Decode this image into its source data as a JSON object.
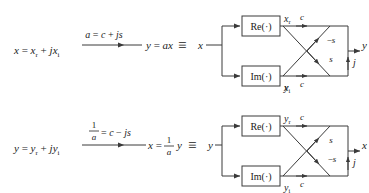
{
  "figure": {
    "type": "signal-flow-diagram",
    "background": "#ffffff",
    "stroke": "#3a3a3a",
    "rows": [
      {
        "id": "row-forward",
        "lhs": "x = xᵣ + jxᵢ",
        "lhs_parts": {
          "var": "x",
          "real": "x",
          "real_sub": "r",
          "imag": "x",
          "imag_sub": "i",
          "j": "j"
        },
        "arrow_label": "a = c + js",
        "arrow_label_is_fraction": false,
        "rhs": "y = ax",
        "equiv": "≡",
        "diagram": {
          "input": "x",
          "output": "y",
          "blocks": [
            {
              "name": "re-block",
              "label": "Re(·)"
            },
            {
              "name": "im-block",
              "label": "Im(·)"
            }
          ],
          "taps": [
            {
              "name": "top-tap",
              "label": "x",
              "sub": "r"
            },
            {
              "name": "bottom-tap",
              "label": "x",
              "sub": "i"
            }
          ],
          "gains": [
            {
              "name": "gain-top-straight",
              "label": "c",
              "path": "top-to-top"
            },
            {
              "name": "gain-cross-up",
              "label": "−s",
              "path": "bottom-to-top"
            },
            {
              "name": "gain-cross-down",
              "label": "s",
              "path": "top-to-bottom"
            },
            {
              "name": "gain-bottom-straight",
              "label": "c",
              "path": "bottom-to-bottom"
            }
          ],
          "sum_label": "j"
        }
      },
      {
        "id": "row-inverse",
        "lhs": "y = yᵣ + jyᵢ",
        "lhs_parts": {
          "var": "y",
          "real": "y",
          "real_sub": "r",
          "imag": "y",
          "imag_sub": "i",
          "j": "j"
        },
        "arrow_label": "1/a = c − js",
        "arrow_label_is_fraction": true,
        "arrow_numerator": "1",
        "arrow_denominator": "a",
        "arrow_rest": "= c − js",
        "rhs": "x = (1/a) y",
        "rhs_numerator": "1",
        "rhs_denominator": "a",
        "rhs_lead": "x =",
        "rhs_tail": "y",
        "equiv": "≡",
        "diagram": {
          "input": "y",
          "output": "x",
          "blocks": [
            {
              "name": "re-block",
              "label": "Re(·)"
            },
            {
              "name": "im-block",
              "label": "Im(·)"
            }
          ],
          "taps": [
            {
              "name": "top-tap",
              "label": "y",
              "sub": "r"
            },
            {
              "name": "bottom-tap",
              "label": "y",
              "sub": "i"
            }
          ],
          "gains": [
            {
              "name": "gain-top-straight",
              "label": "c",
              "path": "top-to-top"
            },
            {
              "name": "gain-cross-up",
              "label": "s",
              "path": "bottom-to-top"
            },
            {
              "name": "gain-cross-down",
              "label": "−s",
              "path": "top-to-bottom"
            },
            {
              "name": "gain-bottom-straight",
              "label": "c",
              "path": "bottom-to-bottom"
            }
          ],
          "sum_label": "j"
        }
      }
    ]
  }
}
